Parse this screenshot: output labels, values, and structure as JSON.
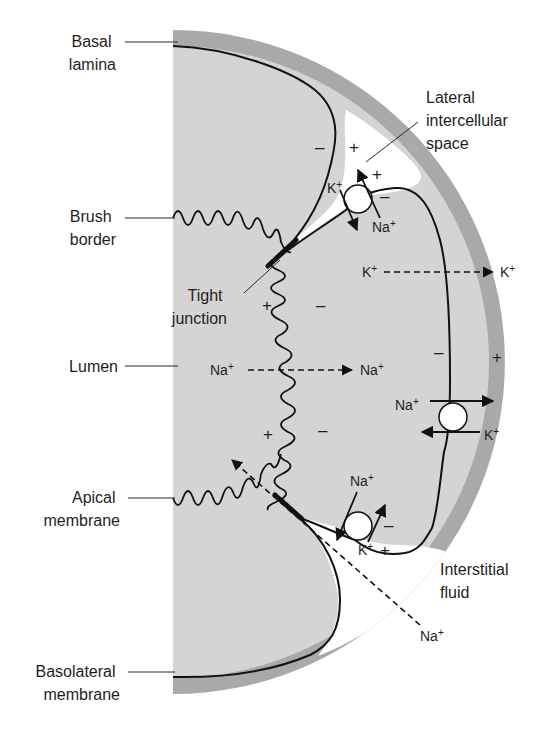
{
  "figure": {
    "colors": {
      "background": "#ffffff",
      "cell": "#d4d4d4",
      "basal_lamina": "#a9a9a9",
      "intercellular_space": "#ffffff",
      "lines": "#111111",
      "text": "#1e1e1e"
    }
  },
  "labels": {
    "basal_lamina": [
      "Basal",
      "lamina"
    ],
    "brush_border": [
      "Brush",
      "border"
    ],
    "tight_junction": [
      "Tight",
      "junction"
    ],
    "lumen": "Lumen",
    "apical_membrane": [
      "Apical",
      "membrane"
    ],
    "basolateral_membrane": [
      "Basolateral",
      "membrane"
    ],
    "lateral_intercellular_space": [
      "Lateral",
      "intercellular",
      "space"
    ],
    "interstitial_fluid": [
      "Interstitial",
      "fluid"
    ]
  },
  "ions": {
    "na": "Na+",
    "k": "K+"
  },
  "transport": [
    {
      "id": "apical-na-entry",
      "ion": "Na+",
      "from": "lumen",
      "to": "cell",
      "type": "passive (dashed)"
    },
    {
      "id": "basolateral-k-exit",
      "ion": "K+",
      "from": "cell",
      "to": "interstitial fluid",
      "type": "passive (dashed)"
    },
    {
      "id": "basolateral-pump",
      "out": "Na+",
      "in": "K+",
      "type": "Na+/K+ pump"
    },
    {
      "id": "upper-lateral-pump",
      "out": "Na+",
      "in": "K+",
      "type": "Na+/K+ pump"
    },
    {
      "id": "lower-lateral-pump",
      "out": "Na+",
      "in": "K+",
      "type": "Na+/K+ pump"
    },
    {
      "id": "paracellular-na",
      "ion": "Na+",
      "from": "interstitial fluid",
      "to": "lumen",
      "type": "paracellular (dashed)"
    }
  ],
  "charges": {
    "plus": "+",
    "minus": "–"
  }
}
